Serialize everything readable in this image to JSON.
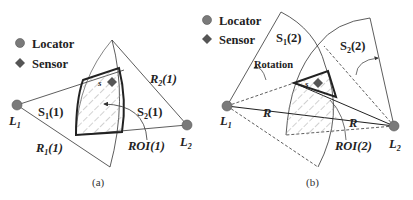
{
  "legend": {
    "locator": "Locator",
    "sensor": "Sensor"
  },
  "colors": {
    "locator_fill": "#7a7a7a",
    "sensor_fill": "#555555",
    "line": "#333333",
    "hatch": "#888888"
  },
  "panel_a": {
    "caption": "(a)",
    "l1": "L",
    "l1_sub": "1",
    "l2": "L",
    "l2_sub": "2",
    "s1": "S",
    "s1_sub": "1",
    "s1_suffix": "(1)",
    "s2": "S",
    "s2_sub": "2",
    "s2_suffix": "(1)",
    "r1": "R",
    "r1_sub": "1",
    "r1_suffix": "(1)",
    "r2": "R",
    "r2_sub": "2",
    "r2_suffix": "(1)",
    "roi": "ROI(1)",
    "sensor_label": "s"
  },
  "panel_b": {
    "caption": "(b)",
    "l1": "L",
    "l1_sub": "1",
    "l2": "L",
    "l2_sub": "2",
    "s1": "S",
    "s1_sub": "1",
    "s1_suffix": "(2)",
    "s2": "S",
    "s2_sub": "2",
    "s2_suffix": "(2)",
    "rotation": "Rotation",
    "r_left": "R",
    "r_right": "R",
    "roi": "ROI(2)",
    "sensor_label": "s"
  }
}
